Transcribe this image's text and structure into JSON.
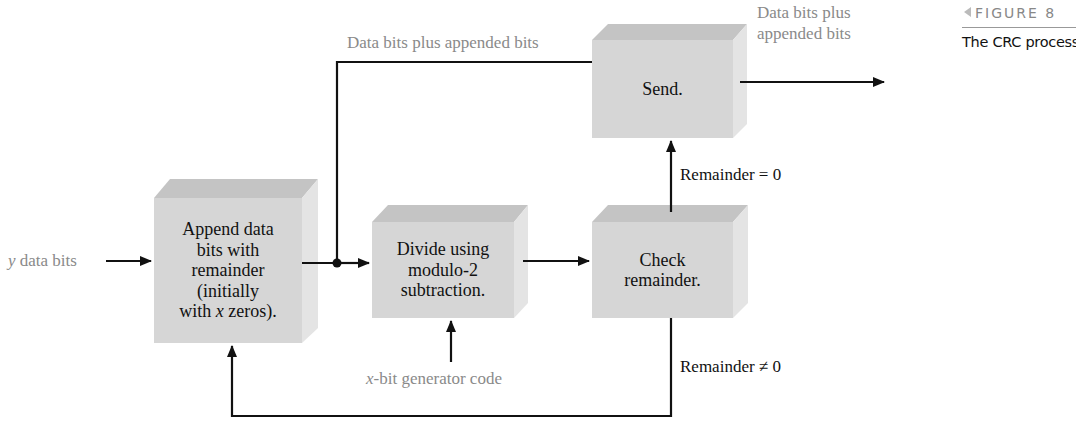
{
  "figure": {
    "number_label": "FIGURE 8",
    "title": "The CRC process."
  },
  "blocks": {
    "append": {
      "text": "Append data bits with remainder (initially with x zeros).",
      "lines": [
        "Append data",
        "bits with",
        "remainder",
        "(initially",
        "with x zeros)."
      ]
    },
    "divide": {
      "text": "Divide using modulo-2 subtraction.",
      "lines": [
        "Divide using",
        "modulo-2",
        "subtraction."
      ]
    },
    "check": {
      "text": "Check remainder.",
      "lines": [
        "Check",
        "remainder."
      ]
    },
    "send": {
      "text": "Send.",
      "lines": [
        "Send."
      ]
    }
  },
  "labels": {
    "input": {
      "var": "y",
      "text": " data bits"
    },
    "top_path": "Data bits plus appended bits",
    "output_line1": "Data bits plus",
    "output_line2": "appended bits",
    "generator": {
      "var": "x",
      "text": "-bit generator code"
    },
    "remainder_zero": "Remainder = 0",
    "remainder_nonzero": "Remainder ≠ 0"
  },
  "colors": {
    "block_face": "#d6d6d6",
    "block_top": "#c4c4c4",
    "block_side": "#e4e4e4",
    "line": "#111111",
    "annotation_text": "#8a8a8a"
  }
}
